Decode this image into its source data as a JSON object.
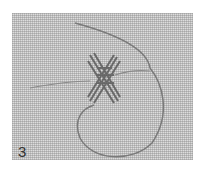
{
  "figure": {
    "step_label": "3",
    "colors": {
      "fabric": "#dcdcdc",
      "thread": "#6e6e6e",
      "stitch": "#5a5a5a"
    }
  }
}
